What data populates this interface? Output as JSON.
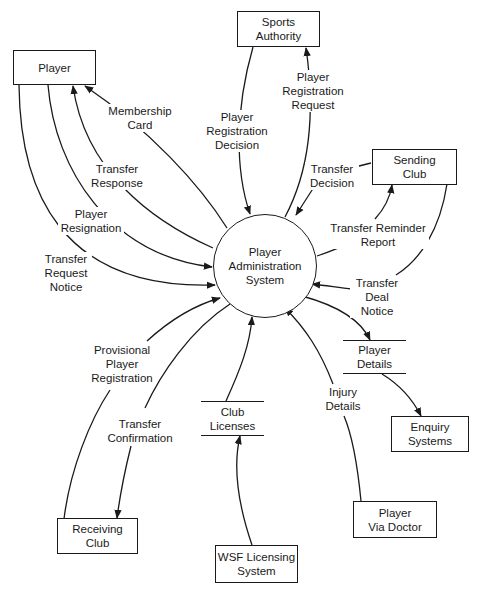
{
  "diagram": {
    "type": "context data flow diagram",
    "process": {
      "id": "player-administration-system",
      "label": "Player\nAdministration\nSystem"
    },
    "external_entities": [
      {
        "id": "player",
        "label": "Player"
      },
      {
        "id": "sports-authority",
        "label": "Sports\nAuthority"
      },
      {
        "id": "sending-club",
        "label": "Sending\nClub"
      },
      {
        "id": "receiving-club",
        "label": "Receiving\nClub"
      },
      {
        "id": "wsf-licensing-system",
        "label": "WSF Licensing\nSystem"
      },
      {
        "id": "player-via-doctor",
        "label": "Player\nVia Doctor"
      },
      {
        "id": "enquiry-systems",
        "label": "Enquiry\nSystems"
      }
    ],
    "data_stores": [
      {
        "id": "player-details",
        "label": "Player\nDetails"
      },
      {
        "id": "club-licenses",
        "label": "Club\nLicenses"
      }
    ],
    "flows": [
      {
        "id": "membership-card",
        "label": "Membership\nCard",
        "from": "Player Administration System",
        "to": "Player"
      },
      {
        "id": "transfer-response",
        "label": "Transfer\nResponse",
        "from": "Player Administration System",
        "to": "Player"
      },
      {
        "id": "player-resignation",
        "label": "Player\nResignation",
        "from": "Player",
        "to": "Player Administration System"
      },
      {
        "id": "transfer-request-notice",
        "label": "Transfer\nRequest\nNotice",
        "from": "Player",
        "to": "Player Administration System"
      },
      {
        "id": "player-registration-decision",
        "label": "Player\nRegistration\nDecision",
        "from": "Sports Authority",
        "to": "Player Administration System"
      },
      {
        "id": "player-registration-request",
        "label": "Player\nRegistration\nRequest",
        "from": "Player Administration System",
        "to": "Sports Authority"
      },
      {
        "id": "transfer-decision",
        "label": "Transfer\nDecision",
        "from": "Sending Club",
        "to": "Player Administration System"
      },
      {
        "id": "transfer-reminder-report",
        "label": "Transfer Reminder\nReport",
        "from": "Player Administration System",
        "to": "Sending Club"
      },
      {
        "id": "transfer-deal-notice",
        "label": "Transfer\nDeal\nNotice",
        "from": "Sending Club",
        "to": "Player Administration System"
      },
      {
        "id": "provisional-player-registration",
        "label": "Provisional\nPlayer\nRegistration",
        "from": "Receiving Club",
        "to": "Player Administration System"
      },
      {
        "id": "transfer-confirmation",
        "label": "Transfer\nConfirmation",
        "from": "Player Administration System",
        "to": "Receiving Club"
      },
      {
        "id": "club-licenses-flow",
        "label": "",
        "from": "Club Licenses",
        "to": "Player Administration System"
      },
      {
        "id": "wsf-licensing-flow",
        "label": "",
        "from": "WSF Licensing System",
        "to": "Club Licenses"
      },
      {
        "id": "injury-details",
        "label": "Injury\nDetails",
        "from": "Player Via Doctor",
        "to": "Player Administration System"
      },
      {
        "id": "player-details-flow",
        "label": "",
        "from": "Player Administration System",
        "to": "Player Details"
      },
      {
        "id": "enquiry-flow",
        "label": "",
        "from": "Player Details",
        "to": "Enquiry Systems"
      }
    ]
  }
}
